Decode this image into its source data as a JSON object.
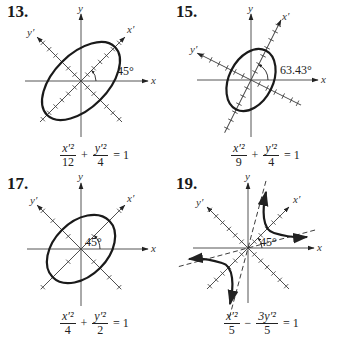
{
  "problems": [
    {
      "number": "13.",
      "angle_label": "45°",
      "equation": {
        "t1_num": "x′²",
        "t1_den": "12",
        "op": "+",
        "t2_num": "y′²",
        "t2_den": "4",
        "rhs": "= 1"
      },
      "axis_labels": {
        "x": "x",
        "y": "y",
        "xp": "x′",
        "yp": "y′"
      },
      "conic": "ellipse",
      "rotation_deg": 45,
      "a2": 12,
      "b2": 4
    },
    {
      "number": "15.",
      "angle_label": "63.43°",
      "equation": {
        "t1_num": "x′²",
        "t1_den": "9",
        "op": "+",
        "t2_num": "y′²",
        "t2_den": "4",
        "rhs": "= 1"
      },
      "axis_labels": {
        "x": "x",
        "y": "y",
        "xp": "x′",
        "yp": "y′"
      },
      "conic": "ellipse",
      "rotation_deg": 63.43,
      "a2": 9,
      "b2": 4
    },
    {
      "number": "17.",
      "angle_label": "45°",
      "equation": {
        "t1_num": "x′²",
        "t1_den": "4",
        "op": "+",
        "t2_num": "y′²",
        "t2_den": "2",
        "rhs": "= 1"
      },
      "axis_labels": {
        "x": "x",
        "y": "y",
        "xp": "x′",
        "yp": "y′"
      },
      "conic": "ellipse",
      "rotation_deg": 45,
      "a2": 4,
      "b2": 2
    },
    {
      "number": "19.",
      "angle_label": "45°",
      "equation": {
        "t1_num": "x′²",
        "t1_den": "5",
        "op": "−",
        "t2_num": "3y′²",
        "t2_den": "5",
        "rhs": "= 1"
      },
      "axis_labels": {
        "x": "x",
        "y": "y",
        "xp": "x′",
        "yp": "y′"
      },
      "conic": "hyperbola",
      "rotation_deg": 45,
      "a2": 5,
      "b2": 1.6667
    }
  ],
  "colors": {
    "ink": "#222222",
    "axis": "#555555",
    "background": "#ffffff"
  }
}
